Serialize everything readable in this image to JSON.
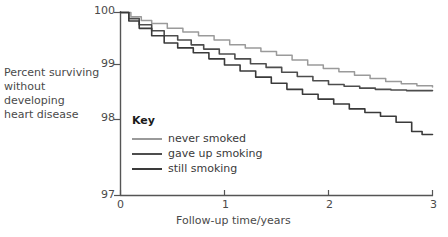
{
  "chart_data": {
    "type": "line",
    "title": "",
    "xlabel": "Follow-up time/years",
    "ylabel": "Percent surviving\nwithout developing\nheart disease",
    "xlim": [
      0,
      3
    ],
    "ylim": [
      97,
      100
    ],
    "xticks": [
      "0",
      "1",
      "2",
      "3"
    ],
    "yticks": [
      "97",
      "98",
      "99",
      "100"
    ],
    "grid": false,
    "legend_title": "Key",
    "legend_position": "inside-lower-left",
    "series": [
      {
        "name": "never smoked",
        "color": "#9a9a9a",
        "x": [
          0,
          0.1,
          0.2,
          0.3,
          0.45,
          0.6,
          0.75,
          0.9,
          1.05,
          1.2,
          1.35,
          1.5,
          1.65,
          1.8,
          1.95,
          2.1,
          2.25,
          2.4,
          2.55,
          2.7,
          2.85,
          3.0
        ],
        "y": [
          100.0,
          99.93,
          99.87,
          99.82,
          99.74,
          99.68,
          99.62,
          99.55,
          99.47,
          99.42,
          99.36,
          99.3,
          99.22,
          99.14,
          99.08,
          99.03,
          98.97,
          98.92,
          98.87,
          98.83,
          98.8,
          98.78
        ]
      },
      {
        "name": "gave up smoking",
        "color": "#4d4d4d",
        "x": [
          0,
          0.08,
          0.18,
          0.3,
          0.42,
          0.55,
          0.68,
          0.8,
          0.95,
          1.1,
          1.25,
          1.4,
          1.55,
          1.7,
          1.85,
          2.0,
          2.15,
          2.3,
          2.45,
          2.6,
          2.75,
          3.0
        ],
        "y": [
          100.0,
          99.9,
          99.8,
          99.7,
          99.62,
          99.55,
          99.47,
          99.4,
          99.32,
          99.24,
          99.16,
          99.1,
          99.02,
          98.95,
          98.88,
          98.82,
          98.79,
          98.76,
          98.74,
          98.73,
          98.72,
          98.72
        ]
      },
      {
        "name": "still smoking",
        "color": "#3a3a3a",
        "x": [
          0,
          0.08,
          0.18,
          0.3,
          0.42,
          0.55,
          0.7,
          0.85,
          1.0,
          1.15,
          1.3,
          1.45,
          1.6,
          1.75,
          1.9,
          2.05,
          2.2,
          2.35,
          2.5,
          2.65,
          2.8,
          2.9,
          3.0
        ],
        "y": [
          100.0,
          99.86,
          99.74,
          99.62,
          99.5,
          99.42,
          99.34,
          99.24,
          99.14,
          99.04,
          98.94,
          98.84,
          98.74,
          98.66,
          98.58,
          98.5,
          98.42,
          98.36,
          98.3,
          98.2,
          98.05,
          98.0,
          98.0
        ]
      }
    ]
  }
}
